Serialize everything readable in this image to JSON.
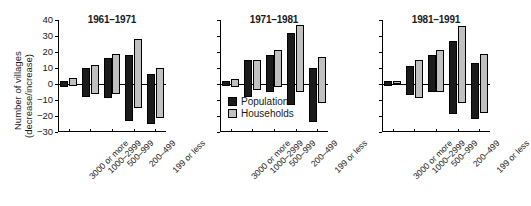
{
  "chart_data": {
    "type": "bar",
    "title": "",
    "xlabel": "",
    "ylabel": "Number of villages (decrease/increase)",
    "ylabel_main": "Number of villages",
    "ylabel_sub": "(decrease/increase)",
    "ylim": [
      -30,
      40
    ],
    "yticks": [
      40,
      30,
      20,
      10,
      0,
      -10,
      -20,
      -30
    ],
    "ytick_labels": [
      "40",
      "30",
      "20",
      "10",
      "0",
      "−10",
      "−20",
      "−30"
    ],
    "grid": false,
    "legend_position": "inside-center-panel-lower-left",
    "legend": [
      {
        "name": "Population",
        "color": "#1b1b1b"
      },
      {
        "name": "Households",
        "color": "#c0c0c0"
      }
    ],
    "categories": [
      "3000 or more",
      "1000–2999",
      "500–999",
      "200–499",
      "199 or less"
    ],
    "note": "Each bar is a floating range from a negative (decrease) value to a positive (increase) value.",
    "panels": [
      {
        "title": "1961–1971",
        "series": [
          {
            "name": "Population",
            "color": "#1b1b1b",
            "increase": [
              2,
              10,
              16,
              18,
              6
            ],
            "decrease": [
              -2,
              -8,
              -9,
              -23,
              -25
            ]
          },
          {
            "name": "Households",
            "color": "#c0c0c0",
            "increase": [
              4,
              12,
              19,
              28,
              10
            ],
            "decrease": [
              -1,
              -6,
              -6,
              -15,
              -21
            ]
          }
        ]
      },
      {
        "title": "1971–1981",
        "series": [
          {
            "name": "Population",
            "color": "#1b1b1b",
            "increase": [
              2,
              15,
              18,
              32,
              10
            ],
            "decrease": [
              -1,
              -8,
              -5,
              -13,
              -24
            ]
          },
          {
            "name": "Households",
            "color": "#c0c0c0",
            "increase": [
              3,
              15,
              21,
              37,
              17
            ],
            "decrease": [
              -2,
              -4,
              -2,
              -5,
              -12
            ]
          }
        ]
      },
      {
        "title": "1981–1991",
        "series": [
          {
            "name": "Population",
            "color": "#1b1b1b",
            "increase": [
              2,
              11,
              18,
              27,
              13
            ],
            "decrease": [
              -1,
              -7,
              -5,
              -19,
              -22
            ]
          },
          {
            "name": "Households",
            "color": "#c0c0c0",
            "increase": [
              2,
              15,
              21,
              36,
              19
            ],
            "decrease": [
              0,
              -9,
              -5,
              -12,
              -18
            ]
          }
        ]
      }
    ]
  }
}
